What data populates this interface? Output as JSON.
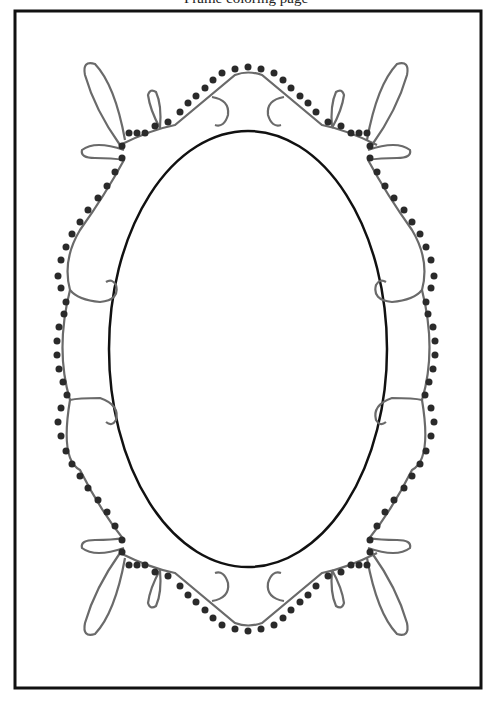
{
  "page": {
    "caption": "Frame coloring page",
    "colors": {
      "border": "#111111",
      "vine": "#6a6a6a",
      "dots": "#2a2a2a",
      "oval": "#111111",
      "background": "#ffffff"
    }
  }
}
